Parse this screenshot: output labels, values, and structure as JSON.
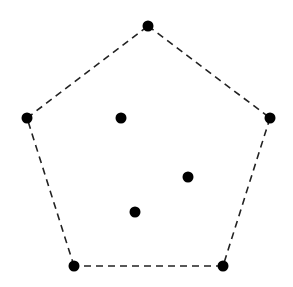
{
  "diagram": {
    "type": "convex-hull",
    "colors": {
      "background": "#ffffff",
      "point": "#000000",
      "edge": "#222222"
    },
    "point_radius": 5.5,
    "edge_style": {
      "stroke_width": 1.6,
      "dash": "7,5"
    },
    "hull_vertices": [
      {
        "id": "v1",
        "x": 148,
        "y": 26
      },
      {
        "id": "v2",
        "x": 270,
        "y": 118
      },
      {
        "id": "v3",
        "x": 223,
        "y": 266
      },
      {
        "id": "v4",
        "x": 74,
        "y": 266
      },
      {
        "id": "v5",
        "x": 27,
        "y": 118
      }
    ],
    "interior_points": [
      {
        "id": "p1",
        "x": 121,
        "y": 118
      },
      {
        "id": "p2",
        "x": 188,
        "y": 177
      },
      {
        "id": "p3",
        "x": 135,
        "y": 212
      }
    ]
  }
}
